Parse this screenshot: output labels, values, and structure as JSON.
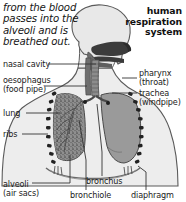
{
  "figure": {
    "title": "human\nrespiration\nsystem",
    "intro_text": "from the blood passes into the alveoli and is breathed out.",
    "colors": {
      "background": "#ffffff",
      "outline": "#4a4a4a",
      "body_fill": "#ededed",
      "head_fill": "#e8e8e8",
      "lung_right_fill": "#9a9a9a",
      "lung_left_fill": "#8f8f8f",
      "cavity_dark": "#3b3b3b",
      "airway_mid": "#6e6e6e",
      "rib_dash": "#222222",
      "leader_line": "#333333",
      "text": "#1a1a1a"
    },
    "labels": [
      {
        "id": "nasal-cavity",
        "text": "nasal cavity",
        "side": "left"
      },
      {
        "id": "oesophagus",
        "text": "oesophagus\n(food pipe)",
        "side": "left"
      },
      {
        "id": "lung",
        "text": "lung",
        "side": "left"
      },
      {
        "id": "ribs",
        "text": "ribs",
        "side": "left"
      },
      {
        "id": "pharynx",
        "text": "pharynx\n(throat)",
        "side": "right"
      },
      {
        "id": "trachea",
        "text": "trachea\n(windpipe)",
        "side": "right"
      },
      {
        "id": "alveoli",
        "text": "alveoli\n(air sacs)",
        "side": "bottom"
      },
      {
        "id": "bronchus",
        "text": "bronchus",
        "side": "bottom"
      },
      {
        "id": "bronchiole",
        "text": "bronchiole",
        "side": "bottom"
      },
      {
        "id": "diaphragm",
        "text": "diaphragm",
        "side": "bottom"
      }
    ]
  }
}
